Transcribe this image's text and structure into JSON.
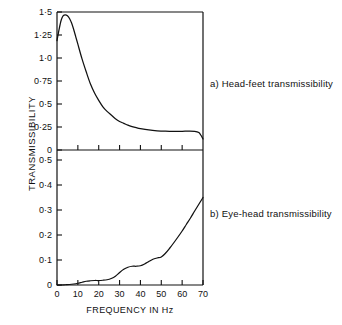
{
  "figure": {
    "y_axis_title": "TRANSMISSIBILITY",
    "x_axis_title": "FREQUENCY IN Hz",
    "caption_a": "a) Head-feet transmissibility",
    "caption_b": "b) Eye-head transmissibility",
    "line_color": "#111111",
    "axis_color": "#111111",
    "background_color": "#ffffff"
  },
  "chart_data": [
    {
      "type": "line",
      "panel": "a",
      "title": "a) Head-feet transmissibility",
      "xlabel": "FREQUENCY IN Hz",
      "ylabel": "TRANSMISSIBILITY",
      "xlim": [
        0,
        70
      ],
      "ylim": [
        0,
        1.5
      ],
      "grid": false,
      "legend": "none",
      "xticks": [
        0,
        10,
        20,
        30,
        40,
        50,
        60,
        70
      ],
      "xticklabels": [
        "0",
        "10",
        "20",
        "30",
        "40",
        "50",
        "60",
        "70"
      ],
      "yticks": [
        0,
        0.25,
        0.5,
        0.75,
        1.0,
        1.25,
        1.5
      ],
      "yticklabels": [
        "0",
        "0·25",
        "0·5",
        "0·75",
        "1·0",
        "1·25",
        "1·5"
      ],
      "series": [
        {
          "name": "Head-feet transmissibility",
          "x": [
            0,
            1,
            2,
            3,
            4,
            5,
            6,
            7,
            8,
            9,
            10,
            12,
            14,
            16,
            18,
            20,
            22,
            24,
            26,
            28,
            30,
            32,
            34,
            36,
            38,
            40,
            44,
            48,
            52,
            56,
            60,
            63,
            66,
            68,
            69,
            70
          ],
          "values": [
            1.19,
            1.31,
            1.41,
            1.46,
            1.47,
            1.46,
            1.43,
            1.38,
            1.31,
            1.23,
            1.15,
            0.99,
            0.85,
            0.72,
            0.62,
            0.54,
            0.47,
            0.42,
            0.38,
            0.34,
            0.31,
            0.29,
            0.27,
            0.255,
            0.243,
            0.233,
            0.218,
            0.209,
            0.204,
            0.202,
            0.203,
            0.205,
            0.203,
            0.19,
            0.16,
            0.12
          ]
        }
      ]
    },
    {
      "type": "line",
      "panel": "b",
      "title": "b) Eye-head transmissibility",
      "xlabel": "FREQUENCY IN Hz",
      "ylabel": "TRANSMISSIBILITY",
      "xlim": [
        0,
        70
      ],
      "ylim": [
        0,
        0.5
      ],
      "grid": false,
      "legend": "none",
      "xticks": [
        0,
        10,
        20,
        30,
        40,
        50,
        60,
        70
      ],
      "xticklabels": [
        "0",
        "10",
        "20",
        "30",
        "40",
        "50",
        "60",
        "70"
      ],
      "yticks": [
        0,
        0.1,
        0.2,
        0.3,
        0.4,
        0.5
      ],
      "yticklabels": [
        "0",
        "0·1",
        "0·2",
        "0·3",
        "0·4",
        "0·5"
      ],
      "series": [
        {
          "name": "Eye-head transmissibility",
          "x": [
            0,
            2,
            4,
            6,
            8,
            10,
            12,
            14,
            16,
            18,
            20,
            22,
            24,
            26,
            28,
            30,
            32,
            34,
            36,
            38,
            40,
            42,
            44,
            46,
            48,
            50,
            52,
            54,
            56,
            58,
            60,
            62,
            64,
            66,
            68,
            70
          ],
          "values": [
            0.0,
            0.0,
            0.001,
            0.002,
            0.004,
            0.007,
            0.011,
            0.015,
            0.017,
            0.018,
            0.018,
            0.019,
            0.021,
            0.026,
            0.035,
            0.05,
            0.063,
            0.071,
            0.075,
            0.075,
            0.077,
            0.084,
            0.094,
            0.103,
            0.108,
            0.112,
            0.127,
            0.147,
            0.169,
            0.192,
            0.216,
            0.242,
            0.268,
            0.296,
            0.323,
            0.35
          ]
        }
      ]
    }
  ]
}
